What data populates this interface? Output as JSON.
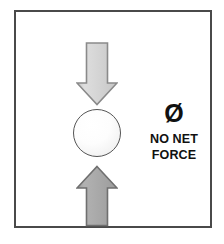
{
  "diagram": {
    "frame": {
      "border_color": "#4a4a4a",
      "background_color": "#ffffff"
    },
    "ball": {
      "name": "ball",
      "outline_color": "#555555",
      "fill_color": "#ffffff"
    },
    "arrows": [
      {
        "name": "downward-force-arrow",
        "direction": "down",
        "fill_color": "#d2d2d2",
        "outline_color": "#8a8a8a"
      },
      {
        "name": "upward-force-arrow",
        "direction": "up",
        "fill_color": "#a6a6a6",
        "outline_color": "#6f6f6f"
      }
    ],
    "label": {
      "symbol": "Ø",
      "symbol_name": "null-set-symbol",
      "line_1": "NO NET",
      "line_2": "FORCE",
      "text_color": "#111111"
    }
  }
}
